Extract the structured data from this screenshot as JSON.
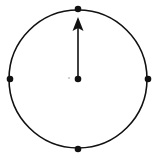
{
  "diagram": {
    "type": "clock-dial",
    "background": "#ffffff",
    "stroke_color": "#111111",
    "circle": {
      "cx": 78,
      "cy": 79,
      "r": 69
    },
    "center_dot": {
      "cx": 78,
      "cy": 79
    },
    "marker_dots": [
      {
        "position": "top",
        "cx": 78,
        "cy": 9
      },
      {
        "position": "right",
        "cx": 148,
        "cy": 79
      },
      {
        "position": "bottom",
        "cx": 78,
        "cy": 149
      },
      {
        "position": "left",
        "cx": 10,
        "cy": 79
      }
    ],
    "hand": {
      "direction": "up",
      "from": [
        78,
        79
      ],
      "to": [
        78,
        18
      ]
    },
    "faint_dot": {
      "cx": 69,
      "cy": 78,
      "color": "#bbbbbb"
    }
  }
}
